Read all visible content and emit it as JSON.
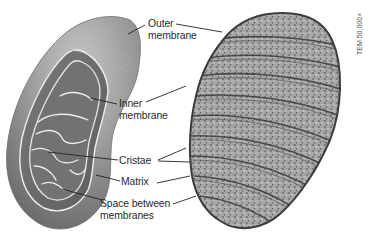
{
  "figure": {
    "labels": {
      "outer_membrane": [
        "Outer",
        "membrane"
      ],
      "inner_membrane": [
        "Inner",
        "membrane"
      ],
      "cristae": "Cristae",
      "matrix": "Matrix",
      "space_between": [
        "Space between",
        "membranes"
      ]
    },
    "micrograph_caption": "TEM 50,000×",
    "colors": {
      "outer_shell": "#8a8a8a",
      "inner_surface": "#6f6f6f",
      "membrane_line": "#e8e8e8",
      "leader_line": "#222222",
      "label_text": "#2a2a2a",
      "micrograph_base": "#9a9a9a",
      "micrograph_dark": "#3c3c3c"
    }
  }
}
